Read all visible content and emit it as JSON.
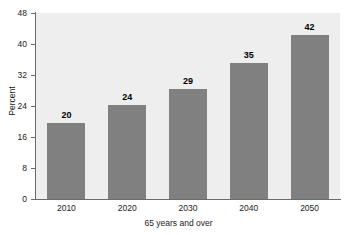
{
  "chart_data": {
    "type": "bar",
    "title": "",
    "subtitle": "",
    "categories": [
      "2010",
      "2020",
      "2030",
      "2040",
      "2050"
    ],
    "values": [
      20,
      24,
      29,
      35,
      42
    ],
    "data_labels": [
      "20",
      "24",
      "29",
      "35",
      "42"
    ],
    "xlabel": "65 years and over",
    "ylabel": "Percent",
    "ylim": [
      0,
      48
    ],
    "xlim_categories": 5,
    "y_ticks": [
      0,
      8,
      16,
      24,
      32,
      40,
      48
    ],
    "y_tick_labels": [
      "0",
      "8",
      "16",
      "24",
      "32",
      "40",
      "48"
    ],
    "grid": false,
    "legend": null,
    "legend_position": "none",
    "annotations": [],
    "colors": {
      "bar_fill": "#808080",
      "plot_background": "#eeeeee",
      "page_background": "#ffffff",
      "axis_line": "#6b6b6b",
      "text": "#1a1a1a",
      "data_label": "#000000"
    },
    "bar_values_plotted": [
      19.6,
      24.3,
      28.3,
      35.0,
      42.2
    ]
  }
}
